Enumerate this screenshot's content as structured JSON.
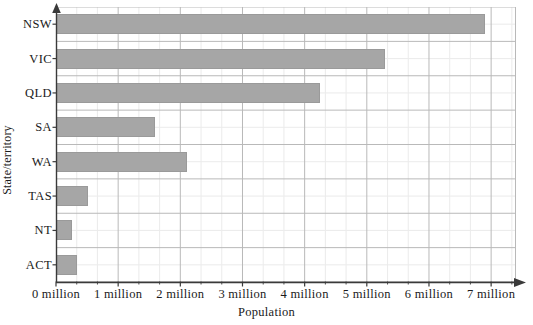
{
  "chart_data": {
    "type": "bar",
    "orientation": "horizontal",
    "title": "",
    "xlabel": "Population",
    "ylabel": "State/territory",
    "categories": [
      "NSW",
      "VIC",
      "QLD",
      "SA",
      "WA",
      "TAS",
      "NT",
      "ACT"
    ],
    "values": [
      6900000,
      5300000,
      4250000,
      1600000,
      2100000,
      520000,
      250000,
      340000
    ],
    "xlim": [
      0,
      7400000
    ],
    "xticks": [
      0,
      1000000,
      2000000,
      3000000,
      4000000,
      5000000,
      6000000,
      7000000
    ],
    "xtick_labels": [
      "0 million",
      "1 million",
      "2 million",
      "3 million",
      "4 million",
      "5 million",
      "6 million",
      "7 million"
    ],
    "grid": true,
    "grid_major_per_million": 1,
    "grid_minor_per_million": 3,
    "legend": null,
    "bar_color": "#a6a6a6",
    "bar_edge_color": "#9a9a9a",
    "grid_major_color": "#b9b9b9",
    "grid_minor_color": "#dcdcdc",
    "axis_color": "#3a3a3a",
    "background_color": "#ffffff"
  },
  "axes": {
    "x_axis_name": "population-axis",
    "y_axis_name": "state-territory-axis",
    "x_arrow": true,
    "y_arrow": true
  }
}
